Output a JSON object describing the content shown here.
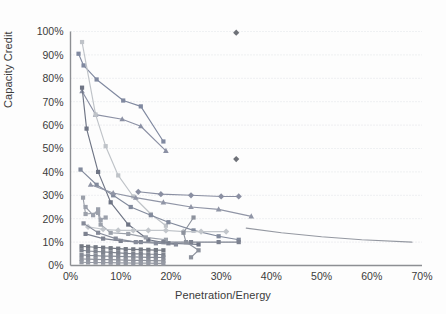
{
  "chart_data": {
    "type": "scatter",
    "title": "",
    "xlabel": "Penetration/Energy",
    "ylabel": "Capacity Credit",
    "xlim": [
      0,
      70
    ],
    "ylim": [
      0,
      100
    ],
    "xticks": [
      "0%",
      "10%",
      "20%",
      "30%",
      "40%",
      "50%",
      "60%",
      "70%"
    ],
    "xtick_values": [
      0,
      10,
      20,
      30,
      40,
      50,
      60,
      70
    ],
    "yticks": [
      "0%",
      "10%",
      "20%",
      "30%",
      "40%",
      "50%",
      "60%",
      "70%",
      "80%",
      "90%",
      "100%"
    ],
    "ytick_values": [
      0,
      10,
      20,
      30,
      40,
      50,
      60,
      70,
      80,
      90,
      100
    ],
    "grid": "horizontal-dotted",
    "legend": "none",
    "x_unit": "%",
    "y_unit": "%",
    "colors": {
      "series_blue_gray": "#7b89a8",
      "series_slate": "#6e7b94",
      "series_light_gray": "#b5b9bf",
      "series_mid_gray": "#9aa0ab",
      "series_dark_gray": "#77797e",
      "series_purple_gray": "#8b86a3",
      "grid": "#d9dde2",
      "axis": "#8d8f93",
      "text": "#3b3b3b",
      "background": "#fdfdfd"
    },
    "series": [
      {
        "name": "series-1-square-high",
        "marker": "square",
        "color": "#8089a0",
        "points": [
          [
            1.6,
            90.5
          ],
          [
            2.6,
            85.5
          ],
          [
            5.2,
            79.5
          ],
          [
            10.5,
            70.5
          ],
          [
            14.0,
            68.0
          ],
          [
            18.5,
            53.0
          ]
        ]
      },
      {
        "name": "series-2-triangle-high",
        "marker": "triangle",
        "color": "#8b90a4",
        "points": [
          [
            2.3,
            74.5
          ],
          [
            5.0,
            64.5
          ],
          [
            10.3,
            62.5
          ],
          [
            14.0,
            59.5
          ],
          [
            19.0,
            49.0
          ]
        ]
      },
      {
        "name": "series-3-lightgray-steep",
        "marker": "square",
        "color": "#bfc3c8",
        "points": [
          [
            2.3,
            95.5
          ],
          [
            5.0,
            64.5
          ],
          [
            7.0,
            51.0
          ],
          [
            9.5,
            38.5
          ],
          [
            12.5,
            29.5
          ],
          [
            16.0,
            22.0
          ],
          [
            19.0,
            17.0
          ]
        ]
      },
      {
        "name": "series-4-darkline-steep",
        "marker": "square",
        "color": "#6f7585",
        "points": [
          [
            2.3,
            76.0
          ],
          [
            3.2,
            58.5
          ],
          [
            5.5,
            40.0
          ],
          [
            8.0,
            27.0
          ],
          [
            11.5,
            17.5
          ],
          [
            15.5,
            11.0
          ],
          [
            19.5,
            9.5
          ],
          [
            25.5,
            9.0
          ]
        ]
      },
      {
        "name": "series-5-mid-decline",
        "marker": "square",
        "color": "#828a9c",
        "points": [
          [
            2.0,
            41.0
          ],
          [
            5.2,
            34.5
          ],
          [
            8.5,
            30.0
          ],
          [
            12.0,
            25.0
          ],
          [
            16.0,
            21.5
          ],
          [
            19.5,
            18.5
          ],
          [
            24.5,
            15.0
          ],
          [
            29.5,
            12.5
          ],
          [
            33.5,
            11.0
          ]
        ]
      },
      {
        "name": "series-6-triangle-mid",
        "marker": "triangle",
        "color": "#9095a6",
        "points": [
          [
            4.0,
            34.5
          ],
          [
            8.5,
            31.0
          ],
          [
            13.0,
            29.0
          ],
          [
            18.5,
            27.0
          ],
          [
            24.0,
            25.0
          ],
          [
            29.5,
            24.0
          ],
          [
            36.0,
            21.0
          ]
        ]
      },
      {
        "name": "series-7-diamond-flat",
        "marker": "diamond",
        "color": "#8a8fa2",
        "points": [
          [
            13.5,
            31.5
          ],
          [
            18.0,
            30.5
          ],
          [
            24.0,
            30.0
          ],
          [
            30.0,
            29.5
          ],
          [
            33.5,
            29.5
          ]
        ]
      },
      {
        "name": "series-8-gray-decline",
        "marker": "square",
        "color": "#9ba0aa",
        "points": [
          [
            2.5,
            29.0
          ],
          [
            3.0,
            22.0
          ],
          [
            5.5,
            22.5
          ],
          [
            6.0,
            17.5
          ],
          [
            8.0,
            14.0
          ],
          [
            11.5,
            13.5
          ],
          [
            15.0,
            12.0
          ],
          [
            19.0,
            11.0
          ]
        ]
      },
      {
        "name": "series-9-light-flat",
        "marker": "diamond",
        "color": "#c2c6cb",
        "points": [
          [
            3.5,
            16.5
          ],
          [
            6.5,
            15.5
          ],
          [
            9.5,
            15.0
          ],
          [
            12.5,
            15.0
          ],
          [
            15.5,
            15.0
          ],
          [
            19.0,
            15.0
          ],
          [
            22.5,
            14.5
          ],
          [
            26.0,
            14.5
          ],
          [
            31.0,
            14.5
          ]
        ]
      },
      {
        "name": "series-10-flat-low",
        "marker": "square",
        "color": "#7d8290",
        "points": [
          [
            3.0,
            13.5
          ],
          [
            6.5,
            11.5
          ],
          [
            10.0,
            10.5
          ],
          [
            14.0,
            10.0
          ],
          [
            18.5,
            10.0
          ],
          [
            24.0,
            10.0
          ],
          [
            29.5,
            10.0
          ],
          [
            33.5,
            10.0
          ]
        ]
      },
      {
        "name": "series-11-steep-to-flat",
        "marker": "square",
        "color": "#868b99",
        "points": [
          [
            2.6,
            18.0
          ],
          [
            5.5,
            14.0
          ],
          [
            9.0,
            11.5
          ],
          [
            13.0,
            10.0
          ],
          [
            17.0,
            9.5
          ],
          [
            21.0,
            9.0
          ]
        ]
      },
      {
        "name": "series-12-long-tail",
        "marker": "none",
        "color": "#9498a1",
        "points": [
          [
            35.0,
            16.0
          ],
          [
            42.0,
            14.0
          ],
          [
            50.0,
            12.3
          ],
          [
            58.0,
            11.0
          ],
          [
            68.0,
            10.0
          ]
        ]
      },
      {
        "name": "series-13-isolated-diamond-top",
        "marker": "diamond",
        "color": "#6e7178",
        "points": [
          [
            33.0,
            99.5
          ]
        ]
      },
      {
        "name": "series-14-isolated-diamond-mid",
        "marker": "diamond",
        "color": "#6e7178",
        "points": [
          [
            33.0,
            45.5
          ]
        ]
      },
      {
        "name": "series-15-square-scatter-right",
        "marker": "square",
        "color": "#8d929d",
        "points": [
          [
            24.5,
            20.5
          ],
          [
            22.5,
            14.0
          ],
          [
            23.0,
            10.0
          ],
          [
            25.5,
            6.5
          ],
          [
            24.0,
            3.5
          ]
        ]
      },
      {
        "name": "series-16-cluster-band-a",
        "marker": "square",
        "color": "#7f848f",
        "points": [
          [
            2.2,
            6.5
          ],
          [
            3.5,
            6.2
          ],
          [
            5.0,
            6.0
          ],
          [
            6.5,
            5.8
          ],
          [
            8.0,
            5.6
          ],
          [
            9.5,
            5.4
          ],
          [
            11.0,
            5.2
          ],
          [
            12.5,
            5.0
          ],
          [
            14.0,
            5.0
          ],
          [
            15.5,
            4.8
          ],
          [
            17.0,
            4.8
          ],
          [
            18.5,
            4.6
          ]
        ]
      },
      {
        "name": "series-17-cluster-band-b",
        "marker": "square",
        "color": "#878c97",
        "points": [
          [
            2.2,
            4.5
          ],
          [
            3.5,
            4.3
          ],
          [
            5.0,
            4.2
          ],
          [
            6.5,
            4.0
          ],
          [
            8.0,
            4.0
          ],
          [
            9.5,
            3.9
          ],
          [
            11.0,
            3.8
          ],
          [
            12.5,
            3.7
          ],
          [
            14.0,
            3.6
          ],
          [
            15.5,
            3.5
          ],
          [
            17.0,
            3.5
          ],
          [
            18.5,
            3.4
          ]
        ]
      },
      {
        "name": "series-18-cluster-band-c",
        "marker": "square",
        "color": "#8f939d",
        "points": [
          [
            2.2,
            2.8
          ],
          [
            3.5,
            2.7
          ],
          [
            5.0,
            2.6
          ],
          [
            6.5,
            2.5
          ],
          [
            8.0,
            2.5
          ],
          [
            9.5,
            2.4
          ],
          [
            11.0,
            2.3
          ],
          [
            12.5,
            2.2
          ],
          [
            14.0,
            2.2
          ],
          [
            15.5,
            2.1
          ],
          [
            17.0,
            2.1
          ],
          [
            18.5,
            2.0
          ]
        ]
      },
      {
        "name": "series-19-cluster-band-d",
        "marker": "square",
        "color": "#969aa4",
        "points": [
          [
            2.2,
            1.4
          ],
          [
            3.5,
            1.3
          ],
          [
            5.0,
            1.3
          ],
          [
            6.5,
            1.2
          ],
          [
            8.0,
            1.2
          ],
          [
            9.5,
            1.1
          ],
          [
            11.0,
            1.1
          ],
          [
            12.5,
            1.0
          ],
          [
            14.0,
            1.0
          ],
          [
            15.5,
            1.0
          ],
          [
            17.0,
            0.9
          ],
          [
            18.5,
            0.9
          ]
        ]
      },
      {
        "name": "series-20-cluster-band-e",
        "marker": "square",
        "color": "#747983",
        "points": [
          [
            2.2,
            8.2
          ],
          [
            3.5,
            8.0
          ],
          [
            5.0,
            7.8
          ],
          [
            6.5,
            7.6
          ],
          [
            8.0,
            7.4
          ],
          [
            9.5,
            7.2
          ],
          [
            11.0,
            7.0
          ],
          [
            12.5,
            6.9
          ],
          [
            14.0,
            6.8
          ],
          [
            15.5,
            6.7
          ],
          [
            17.0,
            6.6
          ],
          [
            18.5,
            6.5
          ]
        ]
      },
      {
        "name": "series-21-small-scatter",
        "marker": "square",
        "color": "#9ba0ab",
        "points": [
          [
            3.0,
            25.0
          ],
          [
            4.5,
            21.5
          ],
          [
            5.5,
            24.0
          ],
          [
            6.0,
            19.5
          ],
          [
            7.0,
            20.5
          ]
        ]
      }
    ]
  },
  "figure": {
    "x_axis_title": "Penetration/Energy",
    "y_axis_title": "Capacity Credit"
  }
}
